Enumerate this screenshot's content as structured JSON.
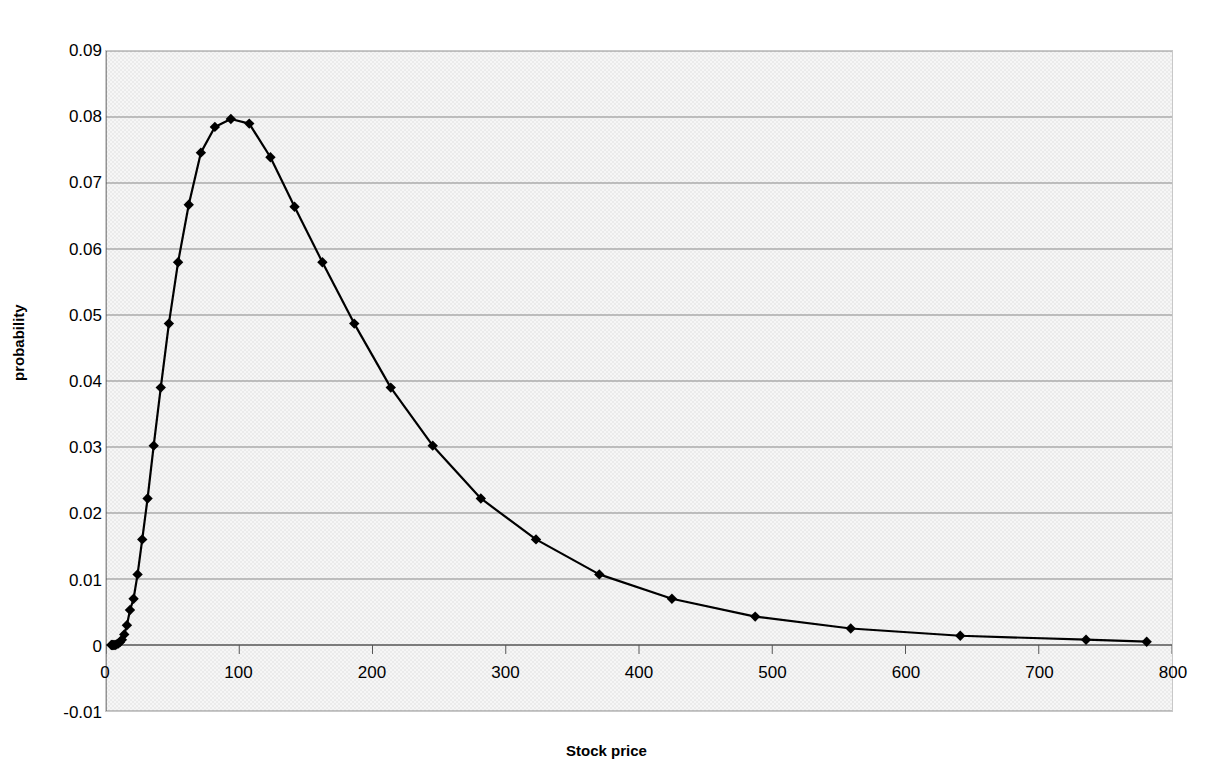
{
  "chart_data": {
    "type": "line",
    "title": "",
    "xlabel": "Stock price",
    "ylabel": "probability",
    "xlim": [
      0,
      800
    ],
    "ylim": [
      -0.01,
      0.09
    ],
    "xticks": [
      0,
      100,
      200,
      300,
      400,
      500,
      600,
      700,
      800
    ],
    "xtick_labels": [
      "0",
      "100",
      "200",
      "300",
      "400",
      "500",
      "600",
      "700",
      "800"
    ],
    "yticks": [
      -0.01,
      0,
      0.01,
      0.02,
      0.03,
      0.04,
      0.05,
      0.06,
      0.07,
      0.08,
      0.09
    ],
    "ytick_labels": [
      "-0.01",
      "0",
      "0.01",
      "0.02",
      "0.03",
      "0.04",
      "0.05",
      "0.06",
      "0.07",
      "0.08",
      "0.09"
    ],
    "grid": "horizontal",
    "legend": "none",
    "marker": "diamond",
    "marker_color": "#000000",
    "line_color": "#000000",
    "plot_background": "#ebebeb",
    "series": [
      {
        "name": "probability",
        "x": [
          4.0,
          4.6,
          5.2,
          6.0,
          6.9,
          7.9,
          9.1,
          10.4,
          11.9,
          13.7,
          15.7,
          18.0,
          20.7,
          23.7,
          27.2,
          31.2,
          35.8,
          41.1,
          47.2,
          54.1,
          62.1,
          71.2,
          81.7,
          93.7,
          107.5,
          123.4,
          141.5,
          162.4,
          186.3,
          213.7,
          245.2,
          281.3,
          322.7,
          370.2,
          424.7,
          487.2,
          558.9,
          641.1,
          735.5,
          781.0
        ],
        "y": [
          0.0,
          0.0,
          0.0,
          0.0,
          0.0,
          0.0001,
          0.0002,
          0.0004,
          0.0008,
          0.0016,
          0.003,
          0.0053,
          0.007,
          0.0107,
          0.016,
          0.0222,
          0.0302,
          0.039,
          0.0487,
          0.058,
          0.0667,
          0.0746,
          0.0785,
          0.0797,
          0.079,
          0.0739,
          0.0664,
          0.058,
          0.0487,
          0.039,
          0.0302,
          0.0222,
          0.016,
          0.0107,
          0.007,
          0.0043,
          0.0025,
          0.0014,
          0.0008,
          0.0005
        ]
      }
    ],
    "marker_x": [
      4.0,
      4.6,
      5.2,
      6.0,
      6.9,
      7.9,
      9.1,
      10.4,
      11.9,
      13.7,
      15.7,
      18.0,
      20.7,
      23.7,
      27.2,
      31.2,
      35.8,
      41.1,
      47.2,
      54.1,
      62.1,
      71.2,
      81.7,
      93.7,
      107.5,
      123.4,
      141.5,
      162.4,
      186.3,
      213.7,
      245.2,
      281.3,
      322.7,
      370.2,
      424.7,
      487.2,
      558.9,
      641.1,
      735.5,
      781.0
    ],
    "peak": {
      "x": 93.7,
      "y": 0.0797
    }
  }
}
